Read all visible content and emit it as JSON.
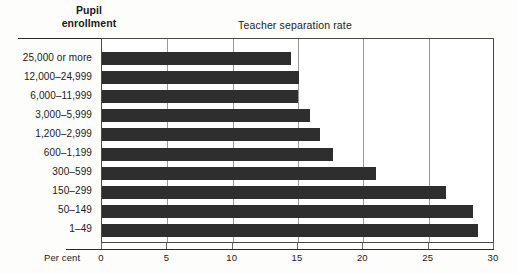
{
  "header": {
    "column_header_line1": "Pupil",
    "column_header_line2": "enrollment",
    "title": "Teacher separation rate"
  },
  "axis": {
    "unit_label": "Per cent",
    "tick_labels": [
      "0",
      "5",
      "10",
      "15",
      "20",
      "25",
      "30"
    ]
  },
  "colors": {
    "bar": "#2e2e2e",
    "gridline": "#9a9a9a",
    "axis": "#2a2a2a",
    "background": "#fdfdfb",
    "plot_background": "#ffffff"
  },
  "chart_data": {
    "type": "bar",
    "orientation": "horizontal",
    "title": "Teacher separation rate",
    "xlabel": "Per cent",
    "ylabel": "Pupil enrollment",
    "xlim": [
      0,
      30
    ],
    "xticks": [
      0,
      5,
      10,
      15,
      20,
      25,
      30
    ],
    "grid": true,
    "legend": "none",
    "categories": [
      "25,000 or more",
      "12,000–24,999",
      "6,000–11,999",
      "3,000–5,999",
      "1,200–2,999",
      "600–1,199",
      "300–599",
      "150–299",
      "50–149",
      "1–49"
    ],
    "values": [
      14.5,
      15.1,
      15.0,
      15.9,
      16.7,
      17.7,
      21.0,
      26.3,
      28.4,
      28.8
    ]
  }
}
